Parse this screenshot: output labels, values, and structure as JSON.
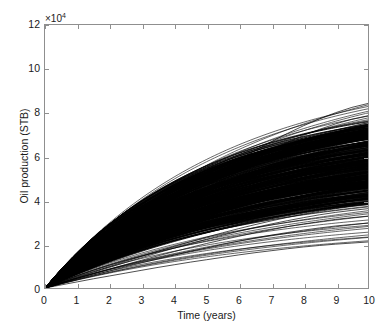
{
  "chart_data": {
    "type": "line",
    "title": "",
    "xlabel": "Time (years)",
    "ylabel": "Oil production (STB)",
    "y_exponent_label": "×10",
    "y_exponent_power": "4",
    "y_scale_factor": 10000,
    "xlim": [
      0,
      10
    ],
    "ylim": [
      0,
      12
    ],
    "xticks": [
      0,
      1,
      2,
      3,
      4,
      5,
      6,
      7,
      8,
      9,
      10
    ],
    "xtick_labels": [
      "0",
      "1",
      "2",
      "3",
      "4",
      "5",
      "6",
      "7",
      "8",
      "9",
      "10"
    ],
    "yticks": [
      0,
      2,
      4,
      6,
      8,
      10,
      12
    ],
    "ytick_labels": [
      "0",
      "2",
      "4",
      "6",
      "8",
      "10",
      "12"
    ],
    "grid": false,
    "legend": null,
    "line_color": "#000000",
    "background_color": "#ffffff",
    "axis_color": "#8f8f8f",
    "x": [
      0,
      0.5,
      1,
      1.5,
      2,
      2.5,
      3,
      3.5,
      4,
      4.5,
      5,
      5.5,
      6,
      6.5,
      7,
      7.5,
      8,
      8.5,
      9,
      9.5,
      10
    ],
    "series": [
      {
        "name": "upper-envelope",
        "role": "maximum realization",
        "values": [
          0,
          0.52,
          1.04,
          1.55,
          2.06,
          2.56,
          3.06,
          3.55,
          4.03,
          4.5,
          4.96,
          5.41,
          5.85,
          6.27,
          6.67,
          7.05,
          7.4,
          7.72,
          8.0,
          8.24,
          8.42
        ]
      },
      {
        "name": "upper-outlier-2",
        "role": "high realization",
        "values": [
          0,
          0.5,
          1.0,
          1.49,
          1.98,
          2.46,
          2.93,
          3.4,
          3.86,
          4.3,
          4.73,
          5.15,
          5.55,
          5.94,
          6.3,
          6.64,
          6.96,
          7.24,
          7.49,
          7.7,
          7.86
        ]
      },
      {
        "name": "bundle-upper-edge",
        "role": "top of dense bundle",
        "values": [
          0,
          0.49,
          0.97,
          1.45,
          1.92,
          2.38,
          2.84,
          3.28,
          3.71,
          4.13,
          4.54,
          4.93,
          5.3,
          5.66,
          5.99,
          6.3,
          6.59,
          6.85,
          7.08,
          7.28,
          7.44
        ]
      },
      {
        "name": "bundle-median",
        "role": "median realization",
        "values": [
          0,
          0.36,
          0.72,
          1.07,
          1.42,
          1.76,
          2.1,
          2.43,
          2.75,
          3.06,
          3.36,
          3.65,
          3.93,
          4.19,
          4.44,
          4.67,
          4.88,
          5.07,
          5.24,
          5.38,
          5.5
        ]
      },
      {
        "name": "bundle-lower-edge",
        "role": "bottom of dense bundle",
        "values": [
          0,
          0.25,
          0.5,
          0.74,
          0.98,
          1.22,
          1.45,
          1.68,
          1.9,
          2.11,
          2.32,
          2.52,
          2.71,
          2.89,
          3.06,
          3.22,
          3.37,
          3.5,
          3.62,
          3.72,
          3.8
        ]
      },
      {
        "name": "lower-outlier-1",
        "role": "low realization",
        "values": [
          0,
          0.24,
          0.48,
          0.71,
          0.94,
          1.17,
          1.39,
          1.61,
          1.82,
          2.02,
          2.22,
          2.41,
          2.59,
          2.76,
          2.92,
          3.07,
          3.21,
          3.34,
          3.45,
          3.54,
          3.62
        ]
      },
      {
        "name": "lower-outlier-2",
        "role": "low realization",
        "values": [
          0,
          0.22,
          0.44,
          0.65,
          0.86,
          1.07,
          1.27,
          1.47,
          1.66,
          1.85,
          2.03,
          2.2,
          2.36,
          2.52,
          2.66,
          2.8,
          2.92,
          3.03,
          3.13,
          3.21,
          3.28
        ]
      },
      {
        "name": "lower-outlier-3",
        "role": "low realization",
        "values": [
          0,
          0.2,
          0.4,
          0.59,
          0.78,
          0.97,
          1.15,
          1.33,
          1.5,
          1.67,
          1.83,
          1.99,
          2.14,
          2.28,
          2.41,
          2.53,
          2.64,
          2.74,
          2.83,
          2.9,
          2.96
        ]
      },
      {
        "name": "minimum-realization",
        "role": "minimum realization",
        "values": [
          0,
          0.14,
          0.28,
          0.42,
          0.55,
          0.68,
          0.81,
          0.94,
          1.06,
          1.18,
          1.29,
          1.4,
          1.51,
          1.61,
          1.7,
          1.79,
          1.87,
          1.94,
          2.0,
          2.05,
          2.1
        ]
      }
    ],
    "ensemble": {
      "count": 500,
      "upper_bound_at_x10": 8.42,
      "lower_bound_at_x10": 2.1,
      "dense_band_at_x10": [
        3.8,
        7.44
      ]
    }
  }
}
